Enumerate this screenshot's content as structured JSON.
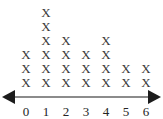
{
  "chart_data": {
    "type": "bar",
    "variant": "dot-plot-x-marks",
    "title": "",
    "subtitle": "",
    "xlabel": "",
    "ylabel": "",
    "categories": [
      "0",
      "1",
      "2",
      "3",
      "4",
      "5",
      "6"
    ],
    "values": [
      3,
      6,
      4,
      3,
      4,
      2,
      2
    ],
    "mark_glyph": "X",
    "total_marks": 24,
    "ylim": [
      0,
      6
    ],
    "grid": false,
    "legend": null,
    "axis_style": "double-headed-arrow",
    "annotations": []
  },
  "axis": {
    "left_arrow_name": "left-arrowhead",
    "right_arrow_name": "right-arrowhead",
    "line_color": "#8b8b8b",
    "arrow_color": "#1c1c1c"
  },
  "style": {
    "background": "#ffffff",
    "mark_color": "#3a3a3a",
    "label_color": "#242424"
  }
}
